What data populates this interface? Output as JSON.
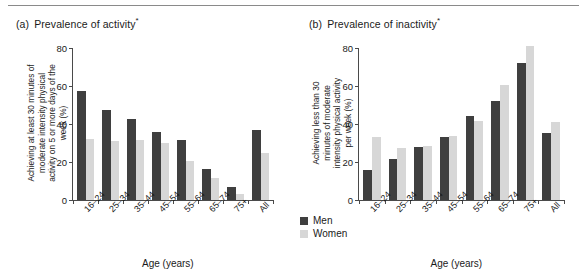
{
  "figure": {
    "panels": [
      {
        "tag": "(a)",
        "title": "Prevalence of activity",
        "star": "*",
        "ylabel_lines": [
          "Achieving at least 30 minutes of",
          "moderate intensity physical",
          "activity on 5 or more days of the",
          "week (%)"
        ],
        "xlabel": "Age (years)"
      },
      {
        "tag": "(b)",
        "title": "Prevalence of inactivity",
        "star": "*",
        "ylabel_lines": [
          "Achieving less than 30",
          "minutes of moderate",
          "intensity physical activity",
          "per week (%)"
        ],
        "xlabel": "Age (years)"
      }
    ],
    "legend": {
      "items": [
        {
          "label": "Men",
          "color": "#3f3f3f"
        },
        {
          "label": "Women",
          "color": "#d7d7d7"
        }
      ]
    }
  },
  "chart_data": [
    {
      "type": "bar",
      "title": "(a) Prevalence of activity*",
      "xlabel": "Age (years)",
      "ylabel": "Achieving at least 30 minutes of moderate intensity physical activity on 5 or more days of the week (%)",
      "categories": [
        "16–24",
        "25–34",
        "35–44",
        "45–54",
        "55–64",
        "65–74",
        "75+",
        "All"
      ],
      "series": [
        {
          "name": "Men",
          "color": "#3f3f3f",
          "values": [
            57.5,
            47.5,
            42.5,
            36.0,
            31.5,
            16.5,
            7.0,
            37.0
          ]
        },
        {
          "name": "Women",
          "color": "#d7d7d7",
          "values": [
            32.0,
            31.0,
            31.5,
            30.0,
            20.5,
            11.5,
            3.0,
            25.0
          ]
        }
      ],
      "ylim": [
        0,
        80
      ],
      "yticks": [
        0,
        20,
        40,
        60,
        80
      ],
      "grid": false,
      "legend_position": "bottom-center"
    },
    {
      "type": "bar",
      "title": "(b) Prevalence of inactivity*",
      "xlabel": "Age (years)",
      "ylabel": "Achieving less than 30 minutes of moderate intensity physical activity per week (%)",
      "categories": [
        "16–24",
        "25–34",
        "35–44",
        "45–54",
        "55–64",
        "65–74",
        "75+",
        "All"
      ],
      "series": [
        {
          "name": "Men",
          "color": "#3f3f3f",
          "values": [
            16.0,
            21.5,
            28.0,
            33.0,
            44.0,
            52.0,
            72.0,
            35.5
          ]
        },
        {
          "name": "Women",
          "color": "#d7d7d7",
          "values": [
            33.0,
            27.5,
            28.5,
            33.5,
            41.5,
            60.5,
            81.0,
            41.0
          ]
        }
      ],
      "ylim": [
        0,
        80
      ],
      "yticks": [
        0,
        20,
        40,
        60,
        80
      ],
      "grid": false,
      "legend_position": "bottom-center"
    }
  ]
}
